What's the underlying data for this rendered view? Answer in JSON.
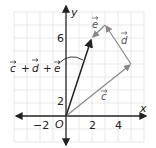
{
  "figure": {
    "axes": {
      "x_label": "x",
      "y_label": "y",
      "origin_label": "O",
      "x_ticks": [
        "−2",
        "2",
        "4"
      ],
      "y_ticks": [
        "2",
        "6"
      ],
      "grid": true
    },
    "vectors": [
      {
        "name": "c",
        "label": "c",
        "from": [
          0,
          0
        ],
        "to": [
          5,
          4
        ],
        "color": "#888888"
      },
      {
        "name": "d",
        "label": "d",
        "from": [
          5,
          4
        ],
        "to": [
          3,
          7
        ],
        "color": "#888888"
      },
      {
        "name": "e",
        "label": "e",
        "from": [
          3,
          7
        ],
        "to": [
          2,
          6
        ],
        "color": "#888888"
      },
      {
        "name": "resultant",
        "label": "c + d + e",
        "from": [
          0,
          0
        ],
        "to": [
          2,
          6
        ],
        "color": "#222222"
      }
    ],
    "resultant_label": {
      "c": "c",
      "plus1": "+",
      "d": "d",
      "plus2": "+",
      "e": "e"
    }
  }
}
